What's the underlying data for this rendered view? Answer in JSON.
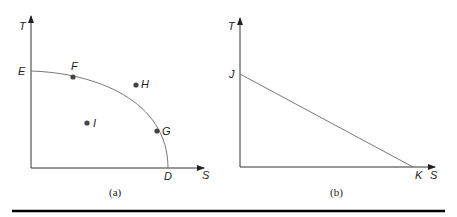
{
  "panel_a": {
    "caption": "(a)",
    "y_axis_label": "T",
    "x_axis_label": "S",
    "intercept_y_label": "E",
    "intercept_x_label": "D",
    "points": [
      {
        "label": "F",
        "on_curve": true
      },
      {
        "label": "H",
        "on_curve": false
      },
      {
        "label": "I",
        "on_curve": false
      },
      {
        "label": "G",
        "on_curve": true
      }
    ]
  },
  "panel_b": {
    "caption": "(b)",
    "y_axis_label": "T",
    "x_axis_label": "S",
    "intercept_y_label": "J",
    "intercept_x_label": "K"
  },
  "colors": {
    "axis": "#333333",
    "curve": "#777777",
    "point": "#444444",
    "rule": "#000000"
  }
}
